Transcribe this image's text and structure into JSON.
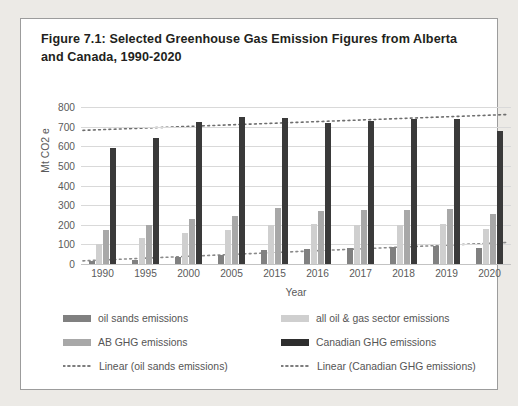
{
  "card": {
    "title": "Figure 7.1: Selected Greenhouse Gas Emission Figures from Alberta and Canada, 1990-2020"
  },
  "chart_data": {
    "type": "bar",
    "title": "Figure 7.1: Selected Greenhouse Gas Emission Figures from Alberta and Canada, 1990-2020",
    "xlabel": "Year",
    "ylabel": "Mt CO2 e",
    "ylim": [
      0,
      800
    ],
    "ytick_step": 100,
    "yticks": [
      "800",
      "700",
      "600",
      "500",
      "400",
      "300",
      "200",
      "100",
      "0"
    ],
    "grid": true,
    "legend_position": "bottom",
    "categories": [
      "1990",
      "1995",
      "2000",
      "2005",
      "2015",
      "2016",
      "2017",
      "2018",
      "2019",
      "2020"
    ],
    "series": [
      {
        "name": "oil sands emissions",
        "color": "#808080",
        "values": [
          15,
          22,
          34,
          45,
          70,
          76,
          82,
          85,
          90,
          81
        ]
      },
      {
        "name": "all oil & gas sector emissions",
        "color": "#cfcfcf",
        "values": [
          101,
          132,
          160,
          175,
          199,
          202,
          198,
          201,
          204,
          179
        ]
      },
      {
        "name": "AB GHG emissions",
        "color": "#a8a8a8",
        "values": [
          172,
          198,
          230,
          245,
          283,
          271,
          273,
          276,
          281,
          256
        ]
      },
      {
        "name": "Canadian GHG emissions",
        "color": "#3a3a3a",
        "values": [
          592,
          642,
          723,
          747,
          742,
          717,
          728,
          738,
          740,
          678
        ]
      }
    ],
    "trendlines": [
      {
        "name": "Linear (oil sands emissions)",
        "style": "dotted",
        "color": "#8a8a8a",
        "start_value": 16,
        "end_value": 110
      },
      {
        "name": "Linear (Canadian GHG emissions)",
        "style": "dotted",
        "color": "#6e6e6e",
        "start_value": 681,
        "end_value": 762
      }
    ]
  },
  "legend": {
    "items": [
      {
        "label": "oil sands emissions",
        "marker": "bar",
        "series": 0
      },
      {
        "label": "all oil & gas sector emissions",
        "marker": "bar",
        "series": 1
      },
      {
        "label": "AB GHG emissions",
        "marker": "bar",
        "series": 2
      },
      {
        "label": "Canadian GHG emissions",
        "marker": "bar",
        "series": 3
      },
      {
        "label": "Linear (oil sands emissions)",
        "marker": "dotted"
      },
      {
        "label": "Linear (Canadian GHG emissions)",
        "marker": "dotted"
      }
    ]
  }
}
